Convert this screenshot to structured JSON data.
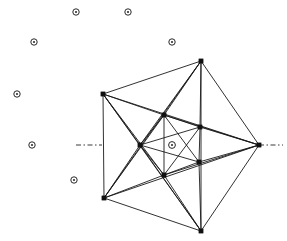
{
  "figure": {
    "background_color": "#ffffff",
    "line_color": "#1a1a1a",
    "marker_stroke_color": "#2a2a2a",
    "axis_color": "#3a3a3a",
    "width": 287,
    "height": 241
  },
  "outer_vertices": [
    {
      "id": "L",
      "name": "outer-left-upper",
      "x": 103,
      "y": 94
    },
    {
      "id": "T",
      "name": "outer-top",
      "x": 201,
      "y": 61
    },
    {
      "id": "R",
      "name": "outer-right",
      "x": 259,
      "y": 145
    },
    {
      "id": "B",
      "name": "outer-bottom",
      "x": 201,
      "y": 231
    },
    {
      "id": "BL",
      "name": "outer-bottom-left",
      "x": 104,
      "y": 198
    }
  ],
  "inner_vertices": [
    {
      "id": "iT",
      "name": "inner-top",
      "x": 164,
      "y": 115
    },
    {
      "id": "iRU",
      "name": "inner-right-upper",
      "x": 200,
      "y": 127
    },
    {
      "id": "iL",
      "name": "inner-left",
      "x": 140,
      "y": 145
    },
    {
      "id": "iRL",
      "name": "inner-right-lower",
      "x": 199,
      "y": 162
    },
    {
      "id": "iB",
      "name": "inner-bottom",
      "x": 164,
      "y": 175
    }
  ],
  "edges": [
    {
      "from": "L",
      "to": "T"
    },
    {
      "from": "T",
      "to": "R"
    },
    {
      "from": "R",
      "to": "B"
    },
    {
      "from": "B",
      "to": "BL"
    },
    {
      "from": "BL",
      "to": "L"
    },
    {
      "from": "L",
      "to": "R"
    },
    {
      "from": "T",
      "to": "B"
    },
    {
      "from": "L",
      "to": "B"
    },
    {
      "from": "BL",
      "to": "T"
    },
    {
      "from": "BL",
      "to": "R"
    },
    {
      "from": "L",
      "to": "iT"
    },
    {
      "from": "L",
      "to": "iL"
    },
    {
      "from": "L",
      "to": "iB"
    },
    {
      "from": "T",
      "to": "iT"
    },
    {
      "from": "T",
      "to": "iL"
    },
    {
      "from": "T",
      "to": "iRU"
    },
    {
      "from": "R",
      "to": "iRU"
    },
    {
      "from": "R",
      "to": "iRL"
    },
    {
      "from": "R",
      "to": "iT"
    },
    {
      "from": "R",
      "to": "iB"
    },
    {
      "from": "B",
      "to": "iB"
    },
    {
      "from": "B",
      "to": "iRL"
    },
    {
      "from": "B",
      "to": "iL"
    },
    {
      "from": "BL",
      "to": "iL"
    },
    {
      "from": "BL",
      "to": "iT"
    },
    {
      "from": "BL",
      "to": "iB"
    },
    {
      "from": "iT",
      "to": "iRU"
    },
    {
      "from": "iRU",
      "to": "iRL"
    },
    {
      "from": "iRL",
      "to": "iB"
    },
    {
      "from": "iB",
      "to": "iL"
    },
    {
      "from": "iL",
      "to": "iT"
    },
    {
      "from": "iT",
      "to": "iB"
    },
    {
      "from": "iL",
      "to": "iRU"
    },
    {
      "from": "iL",
      "to": "iRL"
    },
    {
      "from": "iT",
      "to": "iRL"
    },
    {
      "from": "iRU",
      "to": "iB"
    }
  ],
  "markers": [
    {
      "name": "marker-1",
      "x": 76,
      "y": 12,
      "r": 3.2
    },
    {
      "name": "marker-2",
      "x": 128,
      "y": 12,
      "r": 3.2
    },
    {
      "name": "marker-3",
      "x": 34,
      "y": 42,
      "r": 3.2
    },
    {
      "name": "marker-4",
      "x": 172,
      "y": 42,
      "r": 3.2
    },
    {
      "name": "marker-5",
      "x": 17,
      "y": 94,
      "r": 3.2
    },
    {
      "name": "marker-6",
      "x": 32,
      "y": 145,
      "r": 3.2
    },
    {
      "name": "marker-7",
      "x": 74,
      "y": 180,
      "r": 3.2
    },
    {
      "name": "marker-center",
      "x": 172,
      "y": 145,
      "r": 3.4
    }
  ],
  "axis_segments": [
    {
      "name": "axis-left",
      "x1": 76,
      "y1": 145,
      "x2": 102,
      "y2": 145
    },
    {
      "name": "axis-right",
      "x1": 259,
      "y1": 145,
      "x2": 283,
      "y2": 145
    }
  ]
}
